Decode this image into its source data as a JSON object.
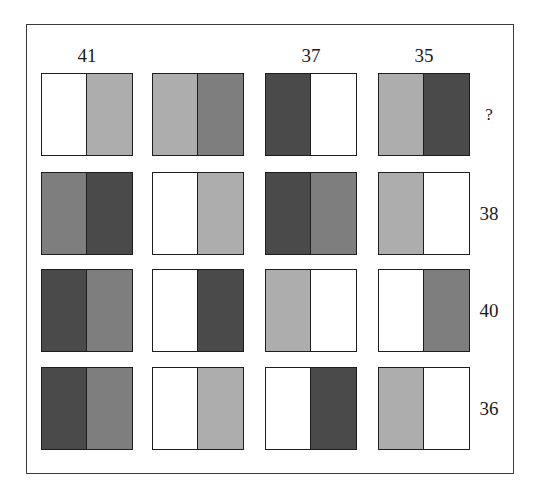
{
  "puzzle": {
    "palette": {
      "white": "#ffffff",
      "light": "#adadad",
      "medium": "#7e7e7e",
      "dark": "#4a4a4a"
    },
    "column_labels": [
      "41",
      "",
      "37",
      "35"
    ],
    "row_labels": [
      "?",
      "38",
      "40",
      "36"
    ],
    "grid": [
      [
        [
          "white",
          "light"
        ],
        [
          "light",
          "medium"
        ],
        [
          "dark",
          "white"
        ],
        [
          "light",
          "dark"
        ]
      ],
      [
        [
          "medium",
          "dark"
        ],
        [
          "white",
          "light"
        ],
        [
          "dark",
          "medium"
        ],
        [
          "light",
          "white"
        ]
      ],
      [
        [
          "dark",
          "medium"
        ],
        [
          "white",
          "dark"
        ],
        [
          "light",
          "white"
        ],
        [
          "white",
          "medium"
        ]
      ],
      [
        [
          "dark",
          "medium"
        ],
        [
          "white",
          "light"
        ],
        [
          "white",
          "dark"
        ],
        [
          "light",
          "white"
        ]
      ]
    ]
  }
}
